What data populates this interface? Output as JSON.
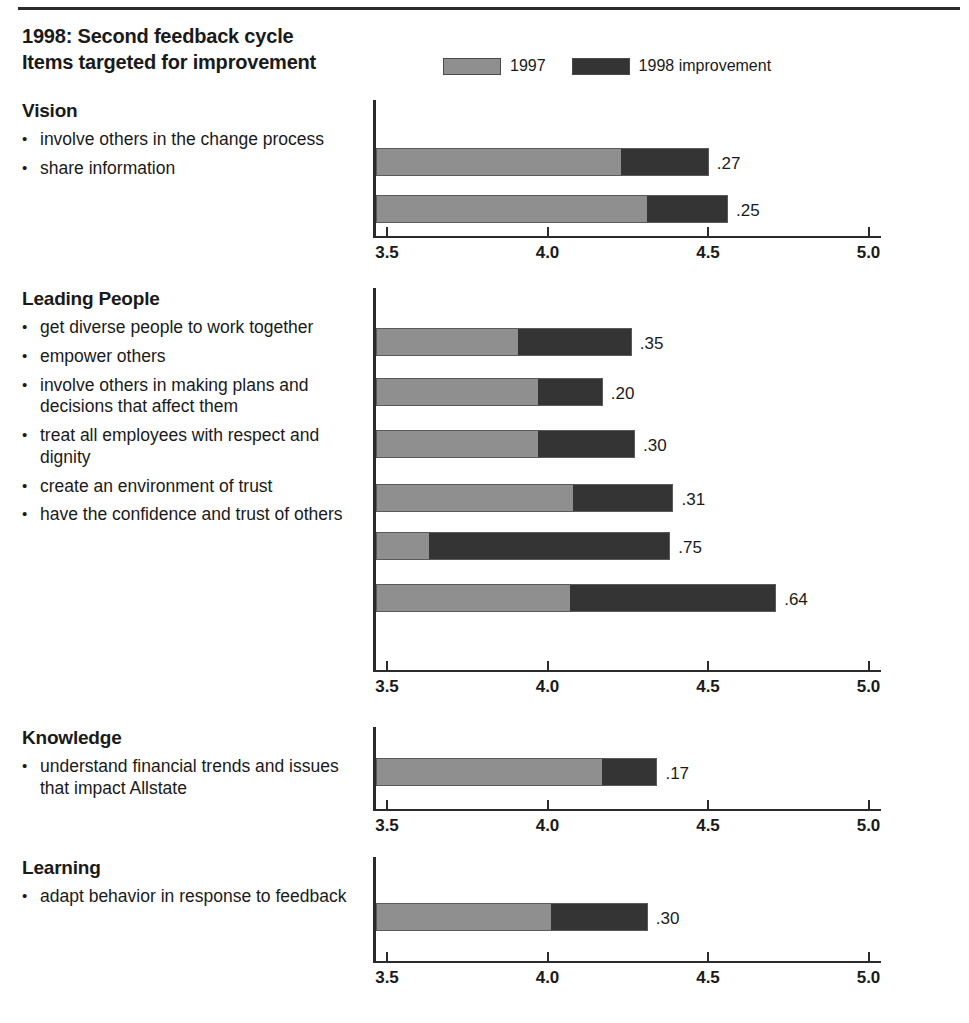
{
  "title": {
    "line1": "1998: Second feedback cycle",
    "line2": "Items targeted for improvement"
  },
  "legend": [
    {
      "label": "1997",
      "color": "#8f8f8f",
      "icon": "legend-swatch-1997"
    },
    {
      "label": "1998 improvement",
      "color": "#343434",
      "icon": "legend-swatch-1998"
    }
  ],
  "bullet_glyph": "•",
  "axis": {
    "ticks": [
      "3.5",
      "4.0",
      "4.5",
      "5.0"
    ],
    "min": 3.5,
    "max": 5.0
  },
  "groups": [
    {
      "name": "Vision",
      "items": [
        {
          "label": "involve others in the change process",
          "base": 4.22,
          "improvement": 0.27,
          "value_label": ".27"
        },
        {
          "label": "share information",
          "base": 4.3,
          "improvement": 0.25,
          "value_label": ".25"
        }
      ]
    },
    {
      "name": "Leading People",
      "items": [
        {
          "label": "get diverse people to work together",
          "base": 3.9,
          "improvement": 0.35,
          "value_label": ".35"
        },
        {
          "label": "empower others",
          "base": 3.96,
          "improvement": 0.2,
          "value_label": ".20"
        },
        {
          "label": "involve others in making plans and decisions that affect them",
          "base": 3.96,
          "improvement": 0.3,
          "value_label": ".30"
        },
        {
          "label": "treat all employees with respect and dignity",
          "base": 4.07,
          "improvement": 0.31,
          "value_label": ".31"
        },
        {
          "label": "create an environment of trust",
          "base": 3.62,
          "improvement": 0.75,
          "value_label": ".75"
        },
        {
          "label": "have the confidence and trust of others",
          "base": 4.06,
          "improvement": 0.64,
          "value_label": ".64"
        }
      ]
    },
    {
      "name": "Knowledge",
      "items": [
        {
          "label": "understand financial trends and issues that impact Allstate",
          "base": 4.16,
          "improvement": 0.17,
          "value_label": ".17"
        }
      ]
    },
    {
      "name": "Learning",
      "items": [
        {
          "label": "adapt behavior in response to feedback",
          "base": 4.0,
          "improvement": 0.3,
          "value_label": ".30"
        }
      ]
    }
  ],
  "chart_data": {
    "type": "bar",
    "orientation": "horizontal",
    "stacked": true,
    "xlabel": "",
    "ylabel": "",
    "xlim": [
      3.5,
      5.0
    ],
    "xticks": [
      3.5,
      4.0,
      4.5,
      5.0
    ],
    "grid": false,
    "legend": [
      "1997",
      "1998 improvement"
    ],
    "legend_position": "top-right",
    "categories": [
      "involve others in the change process",
      "share information",
      "get diverse people to work together",
      "empower others",
      "involve others in making plans and decisions that affect them",
      "treat all employees with respect and dignity",
      "create an environment of trust",
      "have the confidence and trust of others",
      "understand financial trends and issues that impact Allstate",
      "adapt behavior in response to feedback"
    ],
    "category_groups": [
      "Vision",
      "Vision",
      "Leading People",
      "Leading People",
      "Leading People",
      "Leading People",
      "Leading People",
      "Leading People",
      "Knowledge",
      "Learning"
    ],
    "series": [
      {
        "name": "1997",
        "values": [
          4.22,
          4.3,
          3.9,
          3.96,
          3.96,
          4.07,
          3.62,
          4.06,
          4.16,
          4.0
        ]
      },
      {
        "name": "1998 improvement",
        "values": [
          0.27,
          0.25,
          0.35,
          0.2,
          0.3,
          0.31,
          0.75,
          0.64,
          0.17,
          0.3
        ]
      }
    ],
    "totals": [
      4.49,
      4.55,
      4.25,
      4.16,
      4.26,
      4.38,
      4.37,
      4.7,
      4.33,
      4.3
    ],
    "annotations": [
      ".27",
      ".25",
      ".35",
      ".20",
      ".30",
      ".31",
      ".75",
      ".64",
      ".17",
      ".30"
    ]
  }
}
